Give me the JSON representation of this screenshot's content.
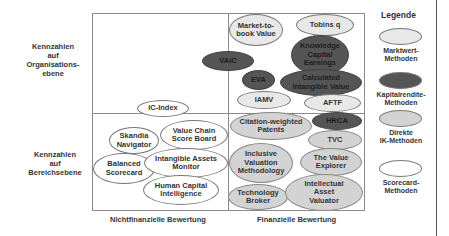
{
  "rows": {
    "top": "Kennzahlen auf Organisations- ebene",
    "top_lines": [
      "Kennzahlen",
      "auf",
      "Organisations-",
      "ebene"
    ],
    "bottom_lines": [
      "Kennzahlen",
      "auf",
      "Bereichsebene"
    ]
  },
  "columns": {
    "left": "Nichtfinanzielle Bewertung",
    "right": "Finanzielle Bewertung"
  },
  "legend": {
    "title": "Legende",
    "items": [
      {
        "label_lines": [
          "Marktwert-",
          "Methoden"
        ],
        "category": "marktwert",
        "color": "#e8e8e8"
      },
      {
        "label_lines": [
          "Kapitalrendite-",
          "Methoden"
        ],
        "category": "kapitalrendite",
        "color": "#555555"
      },
      {
        "label_lines": [
          "Direkte",
          "IK-Methoden"
        ],
        "category": "direkte",
        "color": "#d3d3d3"
      },
      {
        "label_lines": [
          "Scorecard-",
          "Methoden"
        ],
        "category": "scorecard",
        "color": "#ffffff"
      }
    ]
  },
  "methods": [
    {
      "name": "Market-to-book Value",
      "lines": [
        "Market-to-",
        "book Value"
      ],
      "category": "marktwert"
    },
    {
      "name": "Tobins q",
      "lines": [
        "Tobins q"
      ],
      "category": "marktwert"
    },
    {
      "name": "Knowledge Capital Earnings",
      "lines": [
        "Knowledge",
        "Capital",
        "Earnings"
      ],
      "category": "kapitalrendite"
    },
    {
      "name": "VAIC",
      "lines": [
        "VAIC"
      ],
      "category": "kapitalrendite"
    },
    {
      "name": "EVA",
      "lines": [
        "EVA"
      ],
      "category": "kapitalrendite"
    },
    {
      "name": "Calculated Intangible Value",
      "lines": [
        "Calculated",
        "Intangible Value"
      ],
      "category": "kapitalrendite"
    },
    {
      "name": "IAMV",
      "lines": [
        "IAMV"
      ],
      "category": "marktwert"
    },
    {
      "name": "AFTF",
      "lines": [
        "AFTF"
      ],
      "category": "marktwert"
    },
    {
      "name": "IC-Index",
      "lines": [
        "IC-Index"
      ],
      "category": "scorecard"
    },
    {
      "name": "Skandia Navigator",
      "lines": [
        "Skandia",
        "Navigator"
      ],
      "category": "scorecard"
    },
    {
      "name": "Value Chain Score Board",
      "lines": [
        "Value Chain",
        "Score Board"
      ],
      "category": "scorecard"
    },
    {
      "name": "Balanced Scorecard",
      "lines": [
        "Balanced",
        "Scorecard"
      ],
      "category": "scorecard"
    },
    {
      "name": "Intangible Assets Monitor",
      "lines": [
        "Intangible Assets",
        "Monitor"
      ],
      "category": "scorecard"
    },
    {
      "name": "Human Capital Intelligence",
      "lines": [
        "Human Capital",
        "Intelligence"
      ],
      "category": "scorecard"
    },
    {
      "name": "Citation-weighted Patents",
      "lines": [
        "Citation-weighted",
        "Patents"
      ],
      "category": "direkte"
    },
    {
      "name": "HRCA",
      "lines": [
        "HRCA"
      ],
      "category": "kapitalrendite"
    },
    {
      "name": "TVC",
      "lines": [
        "TVC"
      ],
      "category": "direkte"
    },
    {
      "name": "Inclusive Valuation Methodology",
      "lines": [
        "Inclusive",
        "Valuation",
        "Methodology"
      ],
      "category": "direkte"
    },
    {
      "name": "The Value Explorer",
      "lines": [
        "The Value",
        "Explorer"
      ],
      "category": "direkte"
    },
    {
      "name": "Technology Broker",
      "lines": [
        "Technology",
        "Broker"
      ],
      "category": "direkte"
    },
    {
      "name": "Intellectual Asset Valuator",
      "lines": [
        "Intellectual",
        "Asset",
        "Valuator"
      ],
      "category": "direkte"
    }
  ]
}
